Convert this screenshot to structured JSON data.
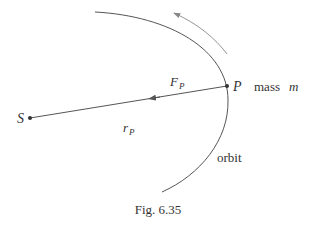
{
  "figure": {
    "caption": "Fig. 6.35",
    "labels": {
      "sun": "S",
      "planet": "P",
      "mass_text": "mass",
      "mass_symbol": "m",
      "force_main": "F",
      "force_sub": "P",
      "radius_main": "r",
      "radius_sub": "P",
      "orbit": "orbit"
    },
    "colors": {
      "line": "#555555",
      "motion_arrow": "#888888",
      "text": "#333333"
    }
  }
}
